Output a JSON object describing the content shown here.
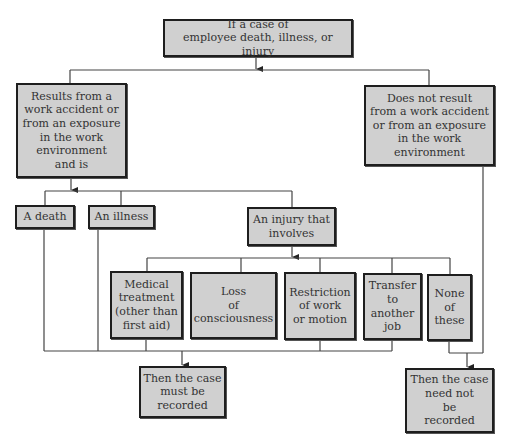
{
  "diagram": {
    "type": "flowchart",
    "colors": {
      "box_fill": "#d0d0d0",
      "box_border": "#1e1e1e",
      "line": "#444444",
      "text": "#333333"
    },
    "nodes": {
      "root": {
        "label": "If a case of\nemployee death, illness, or injury"
      },
      "work_related": {
        "label": "Results from a\nwork accident or\nfrom an exposure\nin the work\nenvironment\nand is"
      },
      "not_work_related": {
        "label": "Does not result\nfrom a work accident\nor from an exposure\nin the work\nenvironment"
      },
      "death": {
        "label": "A death"
      },
      "illness": {
        "label": "An illness"
      },
      "injury": {
        "label": "An injury that\ninvolves"
      },
      "medical": {
        "label": "Medical\ntreatment\n(other than\nfirst aid)"
      },
      "loss": {
        "label": "Loss\nof\nconsciousness"
      },
      "restriction": {
        "label": "Restriction\nof work\nor motion"
      },
      "transfer": {
        "label": "Transfer\nto\nanother\njob"
      },
      "none": {
        "label": "None\nof\nthese"
      },
      "must_record": {
        "label": "Then the case\nmust be\nrecorded"
      },
      "need_not_record": {
        "label": "Then the case\nneed not\nbe\nrecorded"
      }
    },
    "edges": [
      {
        "from": "root",
        "to": "work_related"
      },
      {
        "from": "root",
        "to": "not_work_related"
      },
      {
        "from": "work_related",
        "to": "death"
      },
      {
        "from": "work_related",
        "to": "illness"
      },
      {
        "from": "work_related",
        "to": "injury"
      },
      {
        "from": "injury",
        "to": "medical"
      },
      {
        "from": "injury",
        "to": "loss"
      },
      {
        "from": "injury",
        "to": "restriction"
      },
      {
        "from": "injury",
        "to": "transfer"
      },
      {
        "from": "injury",
        "to": "none"
      },
      {
        "from": "death",
        "to": "must_record"
      },
      {
        "from": "illness",
        "to": "must_record"
      },
      {
        "from": "medical",
        "to": "must_record"
      },
      {
        "from": "loss",
        "to": "must_record"
      },
      {
        "from": "restriction",
        "to": "must_record"
      },
      {
        "from": "transfer",
        "to": "must_record"
      },
      {
        "from": "none",
        "to": "need_not_record"
      },
      {
        "from": "not_work_related",
        "to": "need_not_record"
      }
    ]
  }
}
